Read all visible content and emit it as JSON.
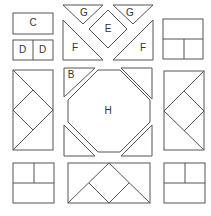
{
  "diagram": {
    "type": "quilt-block-pattern-pieces",
    "labels": {
      "C": "C",
      "D1": "D",
      "D2": "D",
      "G1": "G",
      "G2": "G",
      "E": "E",
      "F1": "F",
      "F2": "F",
      "B": "B",
      "H": "H"
    },
    "colors": {
      "stroke": "#555555",
      "fill": "#ffffff",
      "text": "#333333"
    }
  }
}
